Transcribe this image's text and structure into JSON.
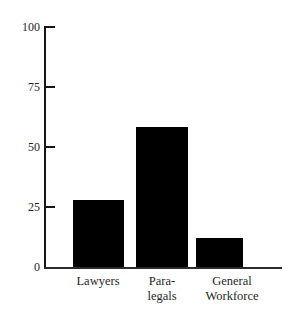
{
  "figure": {
    "title_cutoff_text": "",
    "background_color": "#ffffff",
    "bar_color": "#000000",
    "axis_color": "#161616"
  },
  "axis": {
    "y_ticks": [
      {
        "value": 100,
        "label": "100"
      },
      {
        "value": 75,
        "label": "75"
      },
      {
        "value": 50,
        "label": "50"
      },
      {
        "value": 25,
        "label": "25"
      },
      {
        "value": 0,
        "label": "0"
      }
    ],
    "x_labels": [
      {
        "label": "Lawyers"
      },
      {
        "label": "Para-\nlegals"
      },
      {
        "label": "General\nWorkforce"
      }
    ]
  },
  "chart_data": {
    "type": "bar",
    "title": "",
    "xlabel": "",
    "ylabel": "",
    "categories": [
      "Lawyers",
      "Para-legals",
      "General Workforce"
    ],
    "values": [
      28,
      58,
      12
    ],
    "ylim": [
      0,
      100
    ],
    "yticks": [
      0,
      25,
      50,
      75,
      100
    ],
    "grid": false,
    "legend": false,
    "series": [
      {
        "name": "Percent",
        "values": [
          28,
          58,
          12
        ]
      }
    ]
  }
}
